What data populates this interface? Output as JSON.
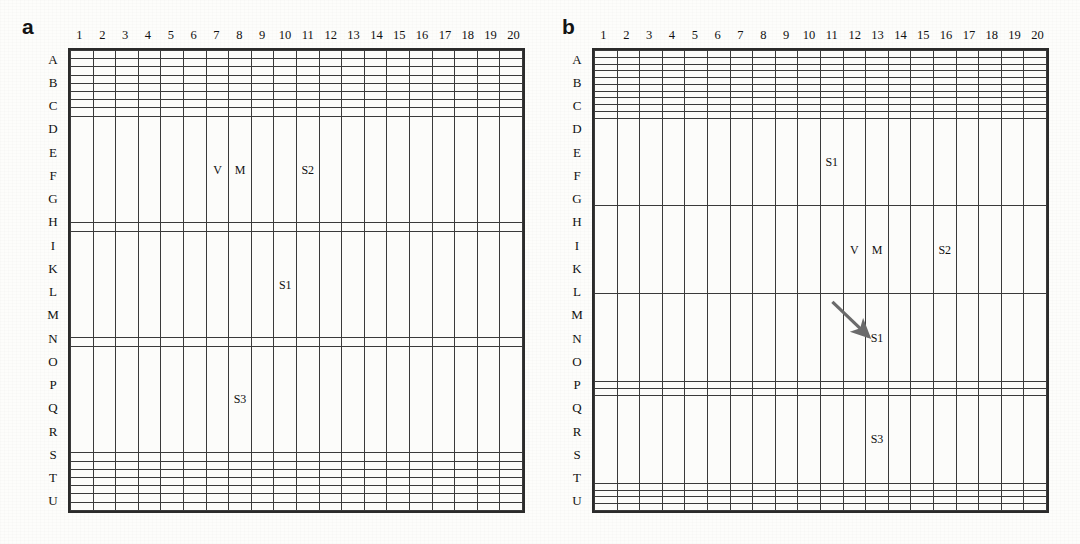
{
  "figure": {
    "type": "two-panel-grid-diagram",
    "background_color": "#fdfdfb",
    "grid_line_color": "#3a3a3a",
    "border_color": "#2b2b2b",
    "arrow_color": "#6b6b6b"
  },
  "grid": {
    "columns": [
      "1",
      "2",
      "3",
      "4",
      "5",
      "6",
      "7",
      "8",
      "9",
      "10",
      "11",
      "12",
      "13",
      "14",
      "15",
      "16",
      "17",
      "18",
      "19",
      "20"
    ],
    "rows": [
      "A",
      "B",
      "C",
      "D",
      "E",
      "F",
      "G",
      "H",
      "I",
      "K",
      "L",
      "M",
      "N",
      "O",
      "P",
      "Q",
      "R",
      "S",
      "T",
      "U"
    ],
    "n_cols": 20,
    "n_rows": 20
  },
  "panels": [
    {
      "label": "a",
      "name": "panel-a",
      "markers": [
        {
          "text": "V",
          "row": "I",
          "col": "7"
        },
        {
          "text": "M",
          "row": "I",
          "col": "8"
        },
        {
          "text": "S2",
          "row": "I",
          "col": "11"
        },
        {
          "text": "S1",
          "row": "L",
          "col": "10"
        },
        {
          "text": "S3",
          "row": "N",
          "col": "8"
        }
      ],
      "arrow": null
    },
    {
      "label": "b",
      "name": "panel-b",
      "markers": [
        {
          "text": "S1",
          "row": "L",
          "col": "11"
        },
        {
          "text": "V",
          "row": "M",
          "col": "12"
        },
        {
          "text": "M",
          "row": "M",
          "col": "13"
        },
        {
          "text": "S2",
          "row": "M",
          "col": "16"
        },
        {
          "text": "S1",
          "row": "N",
          "col": "13"
        },
        {
          "text": "S3",
          "row": "Q",
          "col": "13"
        }
      ],
      "arrow": {
        "from_row": "L",
        "from_col": "11",
        "to_row": "N",
        "to_col": "13",
        "description": "displacement arrow from S1 at L11 to S1 at N13"
      }
    }
  ]
}
